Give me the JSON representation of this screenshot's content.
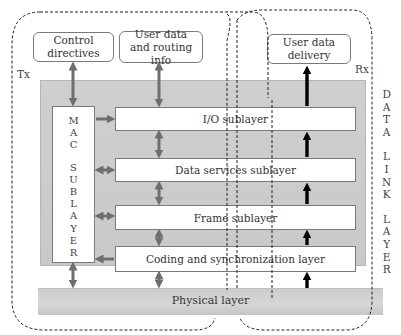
{
  "labels": {
    "tx": "Tx",
    "rx": "Rx"
  },
  "top_boxes": {
    "control_directives": "Control directives",
    "user_data_routing_line1": "User data",
    "user_data_routing_line2": "and routing info",
    "user_data_delivery_line1": "User data",
    "user_data_delivery_line2": "delivery"
  },
  "mac_sublayer": {
    "letters": [
      "M",
      "A",
      "C",
      "",
      "S",
      "U",
      "B",
      "L",
      "A",
      "Y",
      "E",
      "R"
    ]
  },
  "sublayers": [
    {
      "label": "I/O sublayer"
    },
    {
      "label": "Data services sublayer"
    },
    {
      "label": "Frame sublayer"
    },
    {
      "label": "Coding and synchronization layer"
    }
  ],
  "physical_layer": "Physical layer",
  "side_label": {
    "letters": [
      "D",
      "A",
      "T",
      "A",
      "",
      "L",
      "I",
      "N",
      "K",
      "",
      "L",
      "A",
      "Y",
      "E",
      "R"
    ]
  },
  "colors": {
    "band": "#cccccc",
    "gray_arrow": "#6e6e6e",
    "black_arrow": "#000000",
    "box_border": "#7a7a7a"
  }
}
